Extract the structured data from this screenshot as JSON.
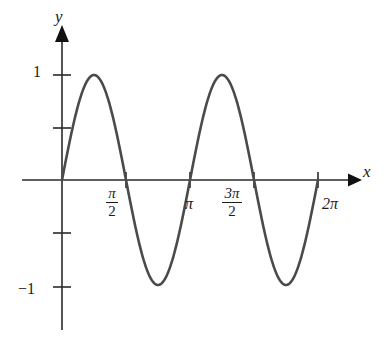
{
  "figure": {
    "background_color": "#ffffff",
    "curve_color": "#4a4a4a",
    "axis_color": "#2a2a2a",
    "text_color": "#1b1b1b"
  },
  "axes": {
    "x_axis_label": "x",
    "y_axis_label": "y",
    "x_arrow_icon": "arrow-right-icon",
    "y_arrow_icon": "arrow-up-icon"
  },
  "y_ticks": {
    "one": "1",
    "negative_one": "−1"
  },
  "x_ticks": {
    "pi_over_2": {
      "numerator": "π",
      "denominator": "2"
    },
    "pi": "π",
    "three_pi_over_2": {
      "numerator": "3π",
      "denominator": "2"
    },
    "two_pi": "2π"
  },
  "chart_data": {
    "type": "line",
    "title": "",
    "xlabel": "x",
    "ylabel": "y",
    "function": "y = sin(2x)",
    "xlim": [
      0,
      6.283185307179586
    ],
    "ylim": [
      -1.35,
      1.35
    ],
    "grid": false,
    "legend": null,
    "x_tick_values": [
      1.5707963267948966,
      3.141592653589793,
      4.71238898038469,
      6.283185307179586
    ],
    "x_tick_labels": [
      "π/2",
      "π",
      "3π/2",
      "2π"
    ],
    "y_tick_values": [
      -1,
      -0.5,
      0.5,
      1
    ],
    "y_tick_labels": [
      "−1",
      "",
      "",
      "1"
    ],
    "series": [
      {
        "name": "y = sin(2x)",
        "color": "#4a4a4a",
        "x": [
          0,
          0.1963,
          0.3927,
          0.589,
          0.7854,
          0.9817,
          1.1781,
          1.3744,
          1.5708,
          1.7671,
          1.9635,
          2.1598,
          2.3562,
          2.5525,
          2.7489,
          2.9452,
          3.1416,
          3.3379,
          3.5343,
          3.7306,
          3.927,
          4.1233,
          4.3197,
          4.516,
          4.7124,
          4.9087,
          5.1051,
          5.3014,
          5.4978,
          5.6941,
          5.8905,
          6.0868,
          6.2832
        ],
        "y": [
          0,
          0.3827,
          0.7071,
          0.9239,
          1,
          0.9239,
          0.7071,
          0.3827,
          0,
          -0.3827,
          -0.7071,
          -0.9239,
          -1,
          -0.9239,
          -0.7071,
          -0.3827,
          0,
          0.3827,
          0.7071,
          0.9239,
          1,
          0.9239,
          0.7071,
          0.3827,
          0,
          -0.3827,
          -0.7071,
          -0.9239,
          -1,
          -0.9239,
          -0.7071,
          -0.3827,
          0
        ],
        "maxima": [
          {
            "x": 0.7854,
            "y": 1
          },
          {
            "x": 3.927,
            "y": 1
          }
        ],
        "minima": [
          {
            "x": 2.3562,
            "y": -1
          },
          {
            "x": 5.4978,
            "y": -1
          }
        ],
        "zeros": [
          0,
          1.5708,
          3.1416,
          4.7124,
          6.2832
        ]
      }
    ]
  }
}
